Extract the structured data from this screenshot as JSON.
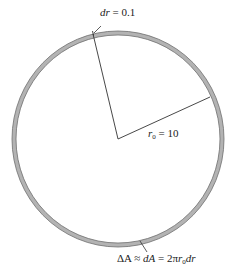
{
  "diagram": {
    "type": "annulus",
    "center": {
      "x": 118,
      "y": 139
    },
    "outer_radius_x": 106,
    "outer_radius_y": 108,
    "ring_thickness": 4,
    "colors": {
      "ring_fill": "#b3b3b3",
      "ring_stroke": "#6e6e6e",
      "line": "#333333",
      "background": "#ffffff"
    },
    "radius_lines": [
      {
        "name": "radius-to-top",
        "x2": 93,
        "y2": 34
      },
      {
        "name": "radius-to-right",
        "x2": 210,
        "y2": 97
      }
    ]
  },
  "labels": {
    "dr": {
      "var": "dr",
      "eq": " = 0.1"
    },
    "r0": {
      "var": "r",
      "sub": "0",
      "eq": " = 10"
    },
    "dA": {
      "prefix": "ΔA ≈ ",
      "var1": "dA",
      "mid": " = 2π",
      "var2": "r",
      "sub": "0",
      "var3": "dr"
    }
  }
}
